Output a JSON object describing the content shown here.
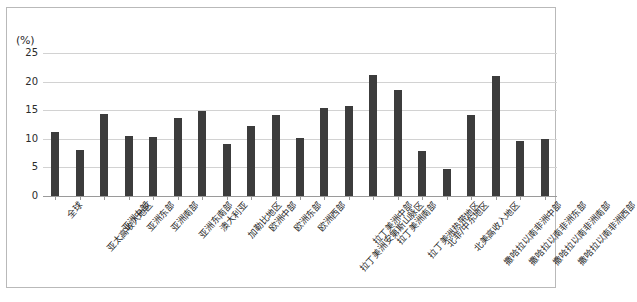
{
  "figure": {
    "unit_label": "(%)",
    "border_color": "#b9b9b9",
    "background": "#ffffff"
  },
  "chart_data": {
    "type": "bar",
    "title": "",
    "subtitle": "",
    "xlabel": "",
    "ylabel": "(%)",
    "ylim": [
      0,
      25
    ],
    "yticks": [
      0,
      5,
      10,
      15,
      20,
      25
    ],
    "ytick_labels": [
      "0",
      "5",
      "10",
      "15",
      "20",
      "25"
    ],
    "grid": true,
    "grid_axis": "y",
    "legend": false,
    "legend_position": "none",
    "bar_color": "#3c3c3c",
    "categories": [
      "全球",
      "亚太高收入地区",
      "亚洲中部",
      "亚洲东部",
      "亚洲南部",
      "亚洲东南部",
      "澳大利亚",
      "加勒比地区",
      "欧洲中部",
      "欧洲东部",
      "欧洲西部",
      "拉丁美洲安第斯山脉区",
      "拉丁美洲中部",
      "拉丁美洲南部",
      "拉丁美洲热带地区",
      "北非/中东地区",
      "北美高收入地区",
      "撒哈拉以南非洲中部",
      "撒哈拉以南非洲东部",
      "撒哈拉以南非洲南部",
      "撒哈拉以南非洲西部"
    ],
    "values": [
      11.2,
      8.0,
      14.3,
      10.5,
      10.4,
      13.6,
      14.8,
      9.1,
      12.3,
      14.1,
      10.2,
      15.4,
      15.8,
      21.1,
      18.5,
      7.8,
      4.7,
      14.1,
      20.9,
      9.6,
      10.0
    ]
  }
}
